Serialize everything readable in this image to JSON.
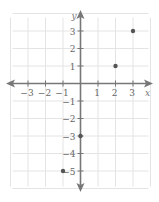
{
  "chart_data": {
    "type": "scatter",
    "title": "",
    "xlabel": "x",
    "ylabel": "y",
    "xlim": [
      -4,
      4
    ],
    "ylim": [
      -6,
      4
    ],
    "grid": true,
    "x_ticks": [
      -3,
      -2,
      -1,
      1,
      2,
      3
    ],
    "y_ticks": [
      3,
      2,
      1,
      -1,
      -2,
      -3,
      -4,
      -5
    ],
    "x_tick_labels": [
      "−3",
      "−2",
      "−1",
      "1",
      "2",
      "3"
    ],
    "y_tick_labels": [
      "3",
      "2",
      "1",
      "−1",
      "−2",
      "−3",
      "−4",
      "−5"
    ],
    "points": [
      {
        "x": 3,
        "y": 3
      },
      {
        "x": 2,
        "y": 1
      },
      {
        "x": 0,
        "y": -3
      },
      {
        "x": -1,
        "y": -5
      }
    ]
  },
  "colors": {
    "grid": "#e4e4e4",
    "axis": "#777777",
    "point": "#555555",
    "text": "#666666"
  }
}
